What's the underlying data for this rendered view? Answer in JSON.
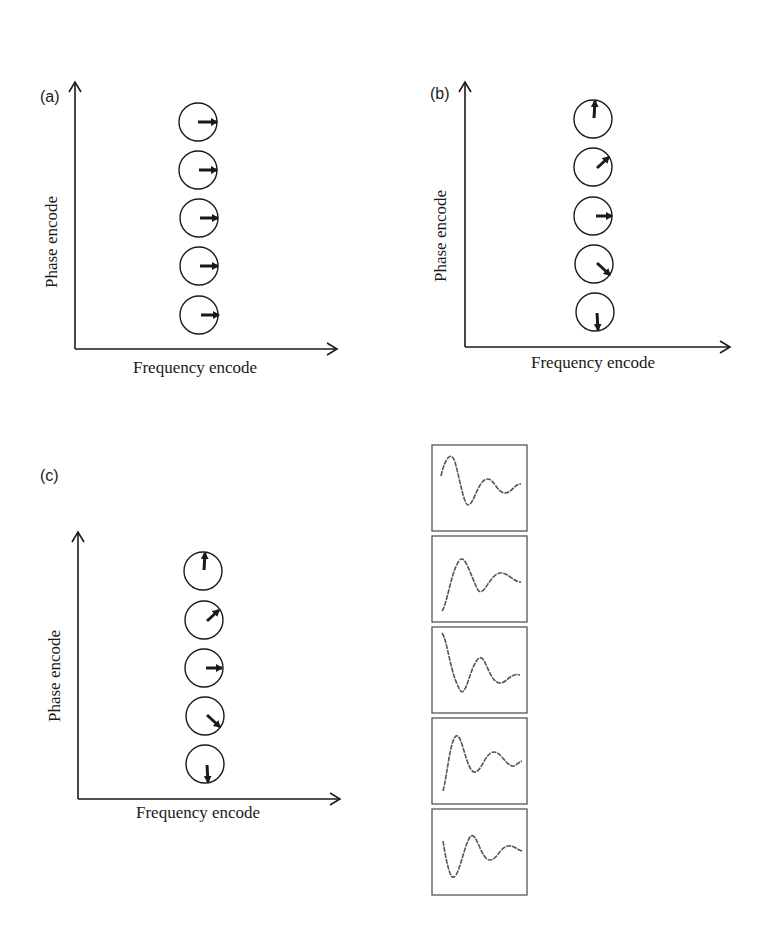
{
  "panels": [
    {
      "label": "(a)",
      "xlabel": "Frequency encode",
      "ylabel": "Phase encode",
      "spin_angles_deg_top_to_bottom": [
        0,
        0,
        0,
        0,
        0
      ]
    },
    {
      "label": "(b)",
      "xlabel": "Frequency encode",
      "ylabel": "Phase encode",
      "spin_angles_deg_top_to_bottom": [
        90,
        45,
        0,
        -45,
        -90
      ]
    },
    {
      "label": "(c)",
      "xlabel": "Frequency encode",
      "ylabel": "Phase encode",
      "spin_angles_deg_top_to_bottom": [
        90,
        45,
        0,
        -45,
        -90
      ]
    }
  ],
  "signal_boxes": {
    "count": 5,
    "description": "Damped oscillation signal traces, one per phase-encode row",
    "start_phase_order": [
      "starts-high",
      "starts-low",
      "starts-high",
      "starts-low",
      "starts-mid-dip"
    ]
  },
  "colors": {
    "ink": "#1a1a1a",
    "box_border": "#555555",
    "signal": "#555555"
  }
}
